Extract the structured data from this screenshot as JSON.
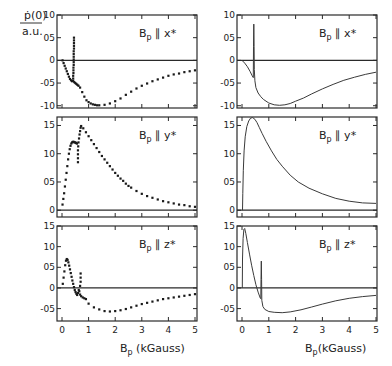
{
  "chart_data": {
    "type": "scatter",
    "figure": "p-dot(0) vs B_p, experiment (left, dots) and theory (right, lines)",
    "ylabel_numerator": "ṗ(0)",
    "ylabel_denominator": "a.u.",
    "xlabel_left": "B",
    "xlabel_left_sub": "p",
    "xlabel_left_unit": " (kGauss)",
    "xlabel_right": "B",
    "xlabel_right_sub": "p",
    "xlabel_right_unit": "(kGauss)",
    "xlim": [
      0,
      5
    ],
    "x_ticks": [
      0,
      1,
      2,
      3,
      4,
      5
    ],
    "x_tick_labels": [
      "0",
      "1",
      "2",
      "3",
      "4",
      "5"
    ],
    "panels": [
      {
        "id": "x-left",
        "column": "left",
        "row": 0,
        "kind": "scatter",
        "label_main": "B",
        "label_sub": "p",
        "label_rest": " ∥ x*",
        "ylim": [
          -1.05,
          1.0
        ],
        "y_ticks": [
          1.0,
          0.5,
          0,
          -0.5,
          -1.0
        ],
        "y_tick_labels": [
          "10",
          "05",
          "0",
          "-05",
          "-10"
        ],
        "points": [
          [
            0.02,
            0.0
          ],
          [
            0.06,
            -0.06
          ],
          [
            0.1,
            -0.12
          ],
          [
            0.14,
            -0.18
          ],
          [
            0.18,
            -0.24
          ],
          [
            0.22,
            -0.3
          ],
          [
            0.26,
            -0.36
          ],
          [
            0.3,
            -0.41
          ],
          [
            0.34,
            -0.44
          ],
          [
            0.38,
            -0.46
          ],
          [
            0.42,
            -0.45
          ],
          [
            0.42,
            -0.4
          ],
          [
            0.42,
            -0.34
          ],
          [
            0.43,
            -0.28
          ],
          [
            0.43,
            -0.22
          ],
          [
            0.43,
            -0.16
          ],
          [
            0.44,
            -0.1
          ],
          [
            0.44,
            -0.04
          ],
          [
            0.44,
            0.02
          ],
          [
            0.44,
            0.08
          ],
          [
            0.44,
            0.14
          ],
          [
            0.44,
            0.2
          ],
          [
            0.45,
            0.26
          ],
          [
            0.45,
            0.32
          ],
          [
            0.45,
            0.38
          ],
          [
            0.45,
            0.44
          ],
          [
            0.45,
            0.5
          ],
          [
            0.46,
            -0.48
          ],
          [
            0.5,
            -0.5
          ],
          [
            0.54,
            -0.52
          ],
          [
            0.58,
            -0.54
          ],
          [
            0.62,
            -0.56
          ],
          [
            0.68,
            -0.6
          ],
          [
            0.76,
            -0.7
          ],
          [
            0.84,
            -0.8
          ],
          [
            0.92,
            -0.88
          ],
          [
            1.0,
            -0.92
          ],
          [
            1.08,
            -0.95
          ],
          [
            1.16,
            -0.97
          ],
          [
            1.24,
            -0.98
          ],
          [
            1.32,
            -0.99
          ],
          [
            1.4,
            -0.99
          ],
          [
            1.6,
            -0.98
          ],
          [
            1.8,
            -0.95
          ],
          [
            2.0,
            -0.9
          ],
          [
            2.2,
            -0.84
          ],
          [
            2.4,
            -0.76
          ],
          [
            2.6,
            -0.69
          ],
          [
            2.8,
            -0.62
          ],
          [
            3.0,
            -0.56
          ],
          [
            3.2,
            -0.51
          ],
          [
            3.4,
            -0.46
          ],
          [
            3.6,
            -0.42
          ],
          [
            3.8,
            -0.38
          ],
          [
            4.0,
            -0.34
          ],
          [
            4.2,
            -0.31
          ],
          [
            4.4,
            -0.29
          ],
          [
            4.6,
            -0.26
          ],
          [
            4.8,
            -0.24
          ],
          [
            5.0,
            -0.22
          ]
        ]
      },
      {
        "id": "y-left",
        "column": "left",
        "row": 1,
        "kind": "scatter",
        "label_main": "B",
        "label_sub": "p",
        "label_rest": " ∥ y*",
        "ylim": [
          -0.12,
          1.65
        ],
        "y_ticks": [
          1.5,
          1.0,
          0.5,
          0
        ],
        "y_tick_labels": [
          "15",
          "10",
          "05",
          "0"
        ],
        "points": [
          [
            0.02,
            0.1
          ],
          [
            0.05,
            0.2
          ],
          [
            0.08,
            0.3
          ],
          [
            0.11,
            0.42
          ],
          [
            0.14,
            0.54
          ],
          [
            0.17,
            0.66
          ],
          [
            0.2,
            0.78
          ],
          [
            0.23,
            0.9
          ],
          [
            0.26,
            1.0
          ],
          [
            0.29,
            1.08
          ],
          [
            0.32,
            1.14
          ],
          [
            0.35,
            1.18
          ],
          [
            0.38,
            1.2
          ],
          [
            0.41,
            1.21
          ],
          [
            0.44,
            1.21
          ],
          [
            0.47,
            1.2
          ],
          [
            0.5,
            1.2
          ],
          [
            0.53,
            1.19
          ],
          [
            0.56,
            1.18
          ],
          [
            0.6,
            0.85
          ],
          [
            0.6,
            0.92
          ],
          [
            0.6,
            0.99
          ],
          [
            0.6,
            1.06
          ],
          [
            0.61,
            1.13
          ],
          [
            0.62,
            1.2
          ],
          [
            0.64,
            1.27
          ],
          [
            0.66,
            1.34
          ],
          [
            0.68,
            1.4
          ],
          [
            0.7,
            1.46
          ],
          [
            0.72,
            1.49
          ],
          [
            0.8,
            1.45
          ],
          [
            0.9,
            1.38
          ],
          [
            1.0,
            1.31
          ],
          [
            1.1,
            1.24
          ],
          [
            1.2,
            1.17
          ],
          [
            1.3,
            1.1
          ],
          [
            1.4,
            1.03
          ],
          [
            1.5,
            0.96
          ],
          [
            1.6,
            0.9
          ],
          [
            1.7,
            0.84
          ],
          [
            1.8,
            0.78
          ],
          [
            1.9,
            0.72
          ],
          [
            2.0,
            0.66
          ],
          [
            2.1,
            0.61
          ],
          [
            2.2,
            0.56
          ],
          [
            2.3,
            0.52
          ],
          [
            2.4,
            0.47
          ],
          [
            2.5,
            0.43
          ],
          [
            2.6,
            0.4
          ],
          [
            2.8,
            0.34
          ],
          [
            3.0,
            0.29
          ],
          [
            3.2,
            0.25
          ],
          [
            3.4,
            0.22
          ],
          [
            3.6,
            0.19
          ],
          [
            3.8,
            0.16
          ],
          [
            4.0,
            0.14
          ],
          [
            4.2,
            0.12
          ],
          [
            4.4,
            0.1
          ],
          [
            4.6,
            0.09
          ],
          [
            4.8,
            0.07
          ],
          [
            5.0,
            0.06
          ]
        ]
      },
      {
        "id": "z-left",
        "column": "left",
        "row": 2,
        "kind": "scatter",
        "label_main": "B",
        "label_sub": "p",
        "label_rest": " ∥ z*",
        "ylim": [
          -0.8,
          1.5
        ],
        "y_ticks": [
          1.5,
          1.0,
          0.5,
          0,
          -0.5
        ],
        "y_tick_labels": [
          "15",
          "10",
          "05",
          "0",
          "-05"
        ],
        "points": [
          [
            0.03,
            0.1
          ],
          [
            0.06,
            0.25
          ],
          [
            0.09,
            0.4
          ],
          [
            0.12,
            0.55
          ],
          [
            0.15,
            0.66
          ],
          [
            0.18,
            0.7
          ],
          [
            0.21,
            0.68
          ],
          [
            0.24,
            0.62
          ],
          [
            0.27,
            0.54
          ],
          [
            0.3,
            0.45
          ],
          [
            0.33,
            0.36
          ],
          [
            0.36,
            0.27
          ],
          [
            0.39,
            0.18
          ],
          [
            0.42,
            0.1
          ],
          [
            0.45,
            0.02
          ],
          [
            0.48,
            -0.05
          ],
          [
            0.51,
            -0.1
          ],
          [
            0.54,
            -0.14
          ],
          [
            0.57,
            -0.17
          ],
          [
            0.6,
            -0.12
          ],
          [
            0.63,
            -0.05
          ],
          [
            0.7,
            0.35
          ],
          [
            0.7,
            0.25
          ],
          [
            0.7,
            0.15
          ],
          [
            0.68,
            0.05
          ],
          [
            0.65,
            -0.08
          ],
          [
            0.68,
            -0.16
          ],
          [
            0.72,
            -0.2
          ],
          [
            0.78,
            -0.23
          ],
          [
            0.84,
            -0.25
          ],
          [
            0.9,
            -0.27
          ],
          [
            1.0,
            -0.38
          ],
          [
            1.2,
            -0.47
          ],
          [
            1.4,
            -0.52
          ],
          [
            1.6,
            -0.56
          ],
          [
            1.8,
            -0.57
          ],
          [
            2.0,
            -0.56
          ],
          [
            2.2,
            -0.54
          ],
          [
            2.4,
            -0.51
          ],
          [
            2.6,
            -0.47
          ],
          [
            2.8,
            -0.43
          ],
          [
            3.0,
            -0.39
          ],
          [
            3.2,
            -0.36
          ],
          [
            3.4,
            -0.33
          ],
          [
            3.6,
            -0.3
          ],
          [
            3.8,
            -0.27
          ],
          [
            4.0,
            -0.25
          ],
          [
            4.2,
            -0.23
          ],
          [
            4.4,
            -0.21
          ],
          [
            4.6,
            -0.19
          ],
          [
            4.8,
            -0.17
          ],
          [
            5.0,
            -0.15
          ]
        ]
      },
      {
        "id": "x-right",
        "column": "right",
        "row": 0,
        "kind": "line",
        "label_main": "B",
        "label_sub": "p",
        "label_rest": " ∥ x*",
        "ylim": [
          -1.05,
          1.0
        ],
        "y_ticks": [
          1.0,
          0.5,
          0,
          -0.5,
          -1.0
        ],
        "y_tick_labels": [
          "10",
          "05",
          "0",
          "-05",
          "-10"
        ],
        "points": [
          [
            0.0,
            0.0
          ],
          [
            0.1,
            -0.06
          ],
          [
            0.2,
            -0.14
          ],
          [
            0.3,
            -0.24
          ],
          [
            0.38,
            -0.34
          ],
          [
            0.42,
            -0.38
          ],
          [
            0.43,
            0.3
          ],
          [
            0.44,
            0.8
          ],
          [
            0.45,
            0.3
          ],
          [
            0.46,
            -0.2
          ],
          [
            0.48,
            -0.45
          ],
          [
            0.52,
            -0.6
          ],
          [
            0.6,
            -0.72
          ],
          [
            0.7,
            -0.8
          ],
          [
            0.8,
            -0.86
          ],
          [
            1.0,
            -0.94
          ],
          [
            1.2,
            -0.98
          ],
          [
            1.4,
            -0.99
          ],
          [
            1.6,
            -0.98
          ],
          [
            1.8,
            -0.95
          ],
          [
            2.0,
            -0.9
          ],
          [
            2.3,
            -0.83
          ],
          [
            2.6,
            -0.74
          ],
          [
            3.0,
            -0.63
          ],
          [
            3.4,
            -0.53
          ],
          [
            3.8,
            -0.44
          ],
          [
            4.2,
            -0.37
          ],
          [
            4.6,
            -0.31
          ],
          [
            5.0,
            -0.26
          ]
        ]
      },
      {
        "id": "y-right",
        "column": "right",
        "row": 1,
        "kind": "line",
        "label_main": "B",
        "label_sub": "p",
        "label_rest": " ∥ y*",
        "ylim": [
          -0.12,
          1.65
        ],
        "y_ticks": [
          1.5,
          1.0,
          0.5,
          0
        ],
        "y_tick_labels": [
          "15",
          "10",
          "05",
          "0"
        ],
        "points": [
          [
            0.02,
            0.0
          ],
          [
            0.03,
            0.3
          ],
          [
            0.05,
            0.7
          ],
          [
            0.08,
            1.05
          ],
          [
            0.12,
            1.3
          ],
          [
            0.18,
            1.48
          ],
          [
            0.25,
            1.58
          ],
          [
            0.32,
            1.63
          ],
          [
            0.4,
            1.64
          ],
          [
            0.48,
            1.61
          ],
          [
            0.56,
            1.55
          ],
          [
            0.65,
            1.46
          ],
          [
            0.75,
            1.36
          ],
          [
            0.9,
            1.22
          ],
          [
            1.1,
            1.05
          ],
          [
            1.3,
            0.9
          ],
          [
            1.5,
            0.78
          ],
          [
            1.8,
            0.62
          ],
          [
            2.1,
            0.5
          ],
          [
            2.5,
            0.39
          ],
          [
            3.0,
            0.29
          ],
          [
            3.5,
            0.21
          ],
          [
            4.0,
            0.16
          ],
          [
            4.5,
            0.13
          ],
          [
            5.0,
            0.12
          ]
        ]
      },
      {
        "id": "z-right",
        "column": "right",
        "row": 2,
        "kind": "line",
        "label_main": "B",
        "label_sub": "p",
        "label_rest": " ∥ z*",
        "ylim": [
          -0.8,
          1.5
        ],
        "y_ticks": [
          1.5,
          1.0,
          0.5,
          0,
          -0.5
        ],
        "y_tick_labels": [
          "15",
          "10",
          "05",
          "0",
          "-05"
        ],
        "points": [
          [
            0.01,
            0.0
          ],
          [
            0.02,
            0.7
          ],
          [
            0.04,
            1.2
          ],
          [
            0.07,
            1.42
          ],
          [
            0.1,
            1.44
          ],
          [
            0.14,
            1.32
          ],
          [
            0.2,
            1.1
          ],
          [
            0.28,
            0.82
          ],
          [
            0.36,
            0.55
          ],
          [
            0.44,
            0.3
          ],
          [
            0.52,
            0.08
          ],
          [
            0.6,
            -0.1
          ],
          [
            0.68,
            -0.24
          ],
          [
            0.7,
            -0.26
          ],
          [
            0.71,
            0.2
          ],
          [
            0.72,
            0.65
          ],
          [
            0.73,
            0.2
          ],
          [
            0.74,
            -0.3
          ],
          [
            0.78,
            -0.45
          ],
          [
            0.85,
            -0.52
          ],
          [
            1.0,
            -0.57
          ],
          [
            1.2,
            -0.59
          ],
          [
            1.5,
            -0.6
          ],
          [
            1.8,
            -0.58
          ],
          [
            2.2,
            -0.53
          ],
          [
            2.6,
            -0.46
          ],
          [
            3.0,
            -0.39
          ],
          [
            3.5,
            -0.31
          ],
          [
            4.0,
            -0.25
          ],
          [
            4.5,
            -0.21
          ],
          [
            5.0,
            -0.18
          ]
        ]
      }
    ]
  }
}
